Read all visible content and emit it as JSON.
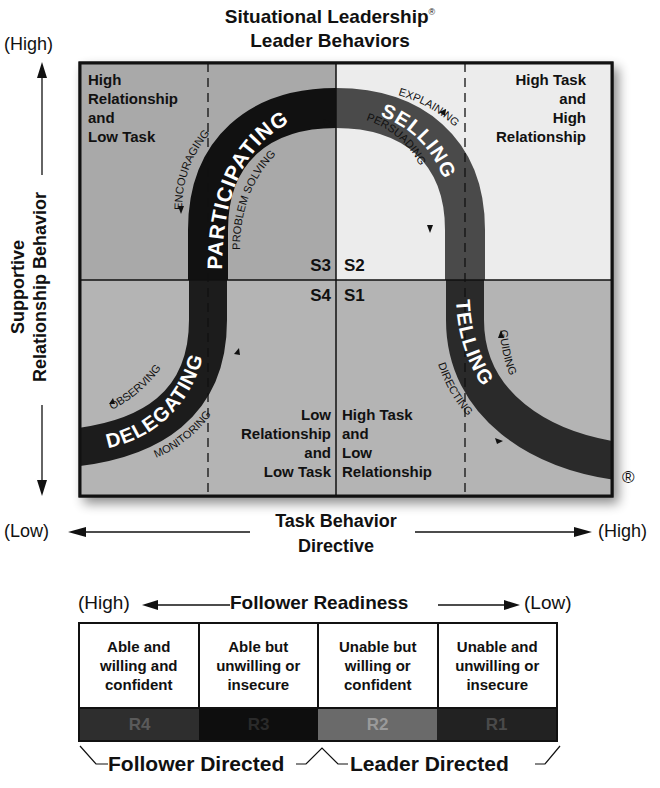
{
  "title": {
    "line1": "Situational Leadership",
    "registered_mark": "®",
    "line2": "Leader Behaviors"
  },
  "y_axis": {
    "high_label": "(High)",
    "label_line1": "Supportive",
    "label_line2": "Relationship Behavior"
  },
  "x_axis": {
    "low_label": "(Low)",
    "high_label": "(High)",
    "label_line1": "Task Behavior",
    "label_line2": "Directive"
  },
  "quadrants": {
    "top_left": {
      "code": "S3",
      "description": [
        "High",
        "Relationship",
        "and",
        "Low Task"
      ],
      "style": "PARTICIPATING",
      "behaviors": [
        "ENCOURAGING",
        "PROBLEM SOLVING"
      ],
      "fill": "#a9a9a9"
    },
    "top_right": {
      "code": "S2",
      "description": [
        "High Task",
        "and",
        "High",
        "Relationship"
      ],
      "style": "SELLING",
      "behaviors": [
        "EXPLAINING",
        "PERSUADING"
      ],
      "fill": "#ececec"
    },
    "bottom_left": {
      "code": "S4",
      "description": [
        "Low",
        "Relationship",
        "and",
        "Low Task"
      ],
      "style": "DELEGATING",
      "behaviors": [
        "OBSERVING",
        "MONITORING"
      ],
      "fill": "#b4b4b4"
    },
    "bottom_right": {
      "code": "S1",
      "description": [
        "High Task",
        "and",
        "Low",
        "Relationship"
      ],
      "style": "TELLING",
      "behaviors": [
        "GUIDING",
        "DIRECTING"
      ],
      "fill": "#b4b4b4"
    }
  },
  "curve_colors": {
    "participating": "#111111",
    "selling": "#4a4a4a",
    "telling": "#2a2a2a",
    "delegating": "#1c1c1c"
  },
  "registered_corner": "®",
  "readiness": {
    "high_label": "(High)",
    "title": "Follower Readiness",
    "low_label": "(Low)",
    "levels": [
      {
        "code": "R4",
        "line1": "Able and",
        "line2": "willing and",
        "line3": "confident",
        "bg": "#2e2e2e",
        "fg": "#5a5a5a"
      },
      {
        "code": "R3",
        "line1": "Able but",
        "line2": "unwilling or",
        "line3": "insecure",
        "bg": "#0e0e0e",
        "fg": "#2a2a2a"
      },
      {
        "code": "R2",
        "line1": "Unable but",
        "line2": "willing or",
        "line3": "confident",
        "bg": "#6a6a6a",
        "fg": "#9a9a9a"
      },
      {
        "code": "R1",
        "line1": "Unable and",
        "line2": "unwilling or",
        "line3": "insecure",
        "bg": "#222222",
        "fg": "#4a4a4a"
      }
    ],
    "follower_directed": "Follower Directed",
    "leader_directed": "Leader Directed"
  }
}
